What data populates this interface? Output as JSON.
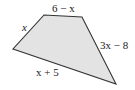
{
  "diagram": {
    "type": "quadrilateral",
    "fill_color": "#e3e3e3",
    "stroke_color": "#333333",
    "vertices": [
      [
        44,
        15
      ],
      [
        82,
        17
      ],
      [
        116,
        84
      ],
      [
        13,
        49
      ]
    ],
    "sides": {
      "top": "6 − x",
      "left": "x",
      "right": "3x − 8",
      "bottom": "x + 5"
    }
  }
}
